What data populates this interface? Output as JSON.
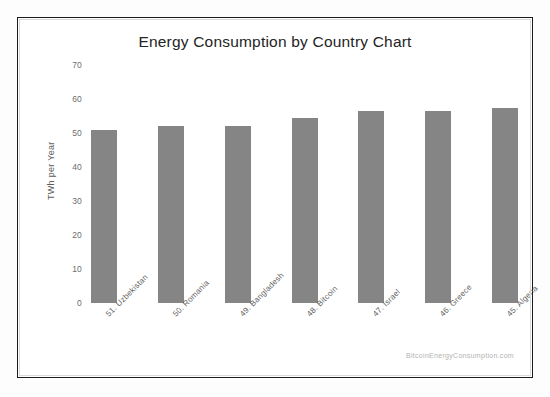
{
  "chart_data": {
    "type": "bar",
    "title": "Energy Consumption by Country Chart",
    "xlabel": "",
    "ylabel": "TWh per Year",
    "ylim": [
      0,
      70
    ],
    "yticks": [
      0,
      10,
      20,
      30,
      40,
      50,
      60,
      70
    ],
    "ytick_labels": [
      "0",
      "10",
      "20",
      "30",
      "40",
      "50",
      "60",
      "70"
    ],
    "grid": false,
    "legend": null,
    "categories": [
      "51. Uzbekistan",
      "50. Romania",
      "49. Bangladesh",
      "48. Bitcoin",
      "47. Israel",
      "46. Greece",
      "45. Algeria"
    ],
    "values": [
      51,
      52,
      52,
      54.3,
      56.5,
      56.5,
      57.3
    ],
    "bar_color": "#858585",
    "annotations": [
      "BitcoinEnergyConsumption.com"
    ]
  },
  "watermark": {
    "text": "BitcoinEnergyConsumption.com"
  },
  "colors": {
    "bar": "#858585",
    "frame": "#1c1c1c",
    "title_text": "#242424",
    "tick_text": "#6d6d6d",
    "watermark_text": "#b3b3b3",
    "background": "#ffffff"
  }
}
